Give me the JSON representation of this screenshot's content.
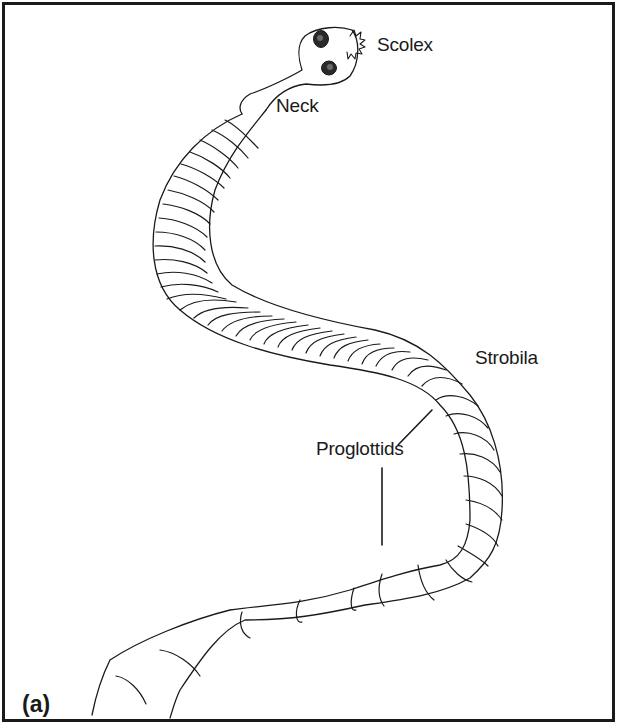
{
  "figure": {
    "panel_label": "(a)",
    "labels": {
      "scolex": "Scolex",
      "neck": "Neck",
      "strobila": "Strobila",
      "proglottids": "Proglottids"
    },
    "colors": {
      "ink": "#1a1a1a",
      "background": "#ffffff"
    }
  }
}
